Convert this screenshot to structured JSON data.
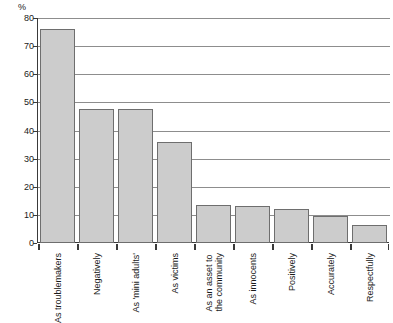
{
  "chart_data": {
    "type": "bar",
    "title": "",
    "xlabel": "",
    "ylabel": "%",
    "unit_label": "%",
    "ylim": [
      0,
      80
    ],
    "yticks": [
      0,
      10,
      20,
      30,
      40,
      50,
      60,
      70,
      80
    ],
    "ytick_labels": [
      "0",
      "10",
      "20",
      "30",
      "40",
      "50",
      "60",
      "70",
      "80"
    ],
    "grid": true,
    "legend": null,
    "categories": [
      "As troublemakers",
      "Negatively",
      "As 'mini adults'",
      "As victims",
      "As an asset to\nthe community",
      "As innocents",
      "Positively",
      "Accurately",
      "Respectfully"
    ],
    "values": [
      76,
      47.5,
      47.5,
      36,
      13.5,
      13,
      12,
      9.5,
      6.5
    ],
    "colors": {
      "bar_fill": "#cccccc",
      "bar_border": "#6e6e6e",
      "gridline": "#8d8d8d",
      "axis": "#3a3a3a",
      "text": "#1a1a1a",
      "background": "#ffffff"
    }
  }
}
